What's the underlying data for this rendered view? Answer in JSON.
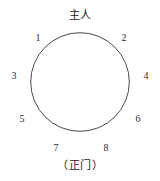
{
  "figure": {
    "kind": "round-table-seating-diagram",
    "width": 160,
    "height": 181,
    "background_color": "#ffffff",
    "stroke_color": "#2b2b2b"
  },
  "table": {
    "shape": "circle",
    "center_x": 80,
    "center_y": 82,
    "radius": 50,
    "stroke_width": 1
  },
  "annotations": {
    "top_label": "主人",
    "bottom_label": "（正门）"
  },
  "seats": [
    {
      "label": "1",
      "x": 38,
      "y": 33
    },
    {
      "label": "2",
      "x": 124,
      "y": 33
    },
    {
      "label": "3",
      "x": 14,
      "y": 71
    },
    {
      "label": "4",
      "x": 146,
      "y": 71
    },
    {
      "label": "5",
      "x": 22,
      "y": 114
    },
    {
      "label": "6",
      "x": 138,
      "y": 114
    },
    {
      "label": "7",
      "x": 56,
      "y": 143
    },
    {
      "label": "8",
      "x": 106,
      "y": 143
    }
  ],
  "label_positions": {
    "top_label_x": 80,
    "top_label_y": 10,
    "bottom_label_x": 80,
    "bottom_label_y": 160
  }
}
